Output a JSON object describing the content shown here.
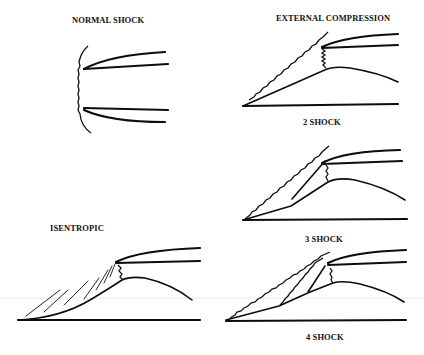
{
  "figure": {
    "panels": [
      {
        "id": "normal-shock",
        "label": "NORMAL SHOCK"
      },
      {
        "id": "external-compression-2-shock",
        "title": "EXTERNAL COMPRESSION",
        "label": "2 SHOCK"
      },
      {
        "id": "external-compression-3-shock",
        "label": "3 SHOCK"
      },
      {
        "id": "isentropic",
        "label": "ISENTROPIC"
      },
      {
        "id": "external-compression-4-shock",
        "label": "4 SHOCK"
      }
    ]
  },
  "colors": {
    "ink": "#0d0d0d",
    "background": "#ffffff"
  }
}
